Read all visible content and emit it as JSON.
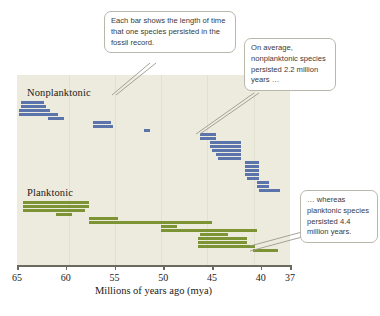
{
  "chart_data": {
    "type": "bar",
    "title": "",
    "subtitle": "",
    "xlabel": "Millions of years ago (mya)",
    "ylabel": "",
    "orientation": "horizontal",
    "grid": "faint vertical gridlines at each 5-million-year tick",
    "legend_position": "inline group labels inside plot area",
    "xlim": [
      65,
      37
    ],
    "x_axis_reversed": true,
    "xticks": [
      65,
      60,
      55,
      50,
      45,
      40,
      37
    ],
    "xtick_labels": [
      "65",
      "60",
      "55",
      "50",
      "45",
      "40",
      "37"
    ],
    "series": [
      {
        "name": "Nonplanktonic",
        "color": "#5b75ac",
        "mean_duration_mya": 2.2,
        "bars": [
          {
            "start": 64.6,
            "end": 62.2
          },
          {
            "start": 64.6,
            "end": 62.0
          },
          {
            "start": 64.8,
            "end": 61.6
          },
          {
            "start": 64.8,
            "end": 60.8
          },
          {
            "start": 61.8,
            "end": 60.2
          },
          {
            "start": 57.2,
            "end": 55.4
          },
          {
            "start": 57.2,
            "end": 55.2
          },
          {
            "start": 52.0,
            "end": 51.4
          },
          {
            "start": 46.2,
            "end": 44.6
          },
          {
            "start": 46.2,
            "end": 44.6
          },
          {
            "start": 45.2,
            "end": 42.0
          },
          {
            "start": 45.2,
            "end": 42.0
          },
          {
            "start": 45.0,
            "end": 42.0
          },
          {
            "start": 44.6,
            "end": 42.0
          },
          {
            "start": 44.4,
            "end": 42.0
          },
          {
            "start": 41.6,
            "end": 40.2
          },
          {
            "start": 41.6,
            "end": 40.2
          },
          {
            "start": 41.6,
            "end": 40.2
          },
          {
            "start": 41.6,
            "end": 40.2
          },
          {
            "start": 41.4,
            "end": 40.2
          },
          {
            "start": 40.4,
            "end": 39.2
          },
          {
            "start": 40.4,
            "end": 39.2
          },
          {
            "start": 40.2,
            "end": 38.0
          }
        ]
      },
      {
        "name": "Planktonic",
        "color": "#7d9434",
        "mean_duration_mya": 4.4,
        "bars": [
          {
            "start": 64.4,
            "end": 57.6
          },
          {
            "start": 64.4,
            "end": 57.6
          },
          {
            "start": 64.4,
            "end": 58.0
          },
          {
            "start": 61.0,
            "end": 59.4
          },
          {
            "start": 57.6,
            "end": 54.6
          },
          {
            "start": 57.6,
            "end": 45.0
          },
          {
            "start": 50.2,
            "end": 48.6
          },
          {
            "start": 50.2,
            "end": 40.4
          },
          {
            "start": 46.2,
            "end": 43.4
          },
          {
            "start": 46.4,
            "end": 41.4
          },
          {
            "start": 46.4,
            "end": 41.4
          },
          {
            "start": 46.4,
            "end": 40.6
          },
          {
            "start": 40.8,
            "end": 38.2
          }
        ]
      }
    ]
  },
  "plot": {
    "group_labels": {
      "nonplanktonic": "Nonplanktonic",
      "planktonic": "Planktonic"
    },
    "axis_title": "Millions of years ago (mya)",
    "tick_labels": [
      "65",
      "60",
      "55",
      "50",
      "45",
      "40",
      "37"
    ],
    "colors": {
      "nonplanktonic_bar": "#5b75ac",
      "planktonic_bar": "#7d9434",
      "panel_background": "#edebdd",
      "axis_line": "#6b6a5e",
      "callout_border": "#b9b7ab"
    }
  },
  "callouts": {
    "bar_meaning": "Each bar shows the length of time that one species persisted in the fossil record.",
    "nonplanktonic_average": "On average, nonplanktonic species persisted 2.2 million years …",
    "planktonic_average": "… whereas planktonic species persisted 4.4 million years."
  },
  "caption": {
    "stub": ""
  }
}
